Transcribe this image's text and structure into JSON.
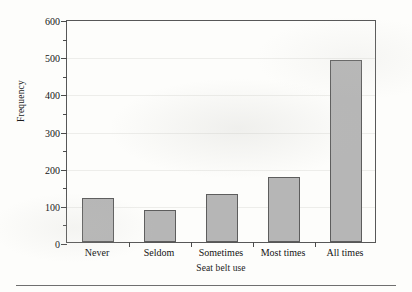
{
  "chart_data": {
    "type": "bar",
    "title": "",
    "xlabel": "Seat belt use",
    "ylabel": "Frequency",
    "categories": [
      "Never",
      "Seldom",
      "Sometimes",
      "Most times",
      "All times"
    ],
    "values": [
      118,
      85,
      128,
      175,
      490
    ],
    "ylim": [
      0,
      600
    ],
    "ytick_labels": [
      "0",
      "100",
      "200",
      "300",
      "400",
      "500",
      "600"
    ],
    "ytick_values": [
      0,
      100,
      200,
      300,
      400,
      500,
      600
    ],
    "yminor_values": [
      50,
      150,
      250,
      350,
      450,
      550
    ],
    "grid": "horizontal",
    "legend": "none",
    "series": [
      {
        "name": "Frequency",
        "values": [
          118,
          85,
          128,
          175,
          490
        ]
      }
    ],
    "colors": {
      "bar_fill": "#b6b6b6",
      "bar_edge": "#5d5d5d",
      "axis": "#575757",
      "grid": "#ededea",
      "text": "#141414",
      "background": "#fdfdfb"
    }
  }
}
